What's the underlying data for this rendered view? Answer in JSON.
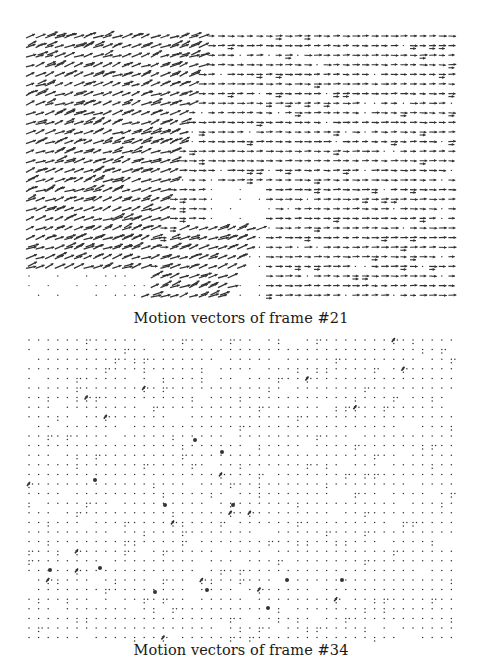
{
  "figure": {
    "panels": [
      {
        "id": "frame-21",
        "caption": "Motion vectors of frame #21",
        "description": "Dense motion vector field; predominantly rightward arrows in the right half, diagonal up-right arrows with heavy clustering in the left region and a diagonal band in the lower-middle; sparse dots in a few regions."
      },
      {
        "id": "frame-34",
        "caption": "Motion vectors of frame #34",
        "description": "Sparse motion vector field; mostly near-zero vectors rendered as dots on a regular grid, with a few isolated short arrows and clustered marks."
      }
    ],
    "grid": {
      "spacing_px": 9.6,
      "x_start": 29,
      "x_end": 460
    },
    "ink_color": "#333333"
  }
}
